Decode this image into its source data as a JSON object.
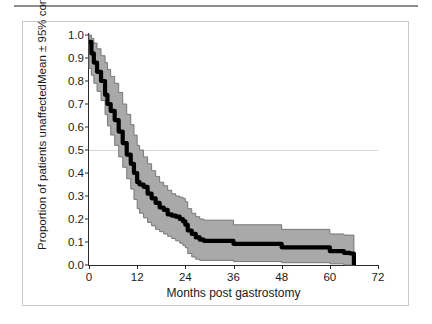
{
  "figure": {
    "axis_color": "#2b2b2b",
    "band_color": "#a9a9a9",
    "band_edge_color": "#6e6e6e",
    "mean_color": "#000000",
    "grid_color": "#d7d7d7",
    "frame_color": "#c9c9c9"
  },
  "chart_data": {
    "type": "line",
    "title": "",
    "subtitle": "",
    "xlabel": "Months post gastrostomy",
    "ylabel_line1": "Proportion of patients unaffected",
    "ylabel_line2": "Mean ± 95% confidence interval",
    "xlim": [
      0,
      72
    ],
    "ylim": [
      0,
      1.0
    ],
    "xticks": [
      0,
      12,
      24,
      36,
      48,
      60,
      72
    ],
    "xtick_labels": [
      "0",
      "12",
      "24",
      "36",
      "48",
      "60",
      "72"
    ],
    "yticks": [
      0.0,
      0.1,
      0.2,
      0.3,
      0.4,
      0.5,
      0.6,
      0.7,
      0.8,
      0.9,
      1.0
    ],
    "ytick_labels": [
      "0.0",
      "0.1",
      "0.2",
      "0.3",
      "0.4",
      "0.5",
      "0.6",
      "0.7",
      "0.8",
      "0.9",
      "1.0"
    ],
    "grid": "single horizontal gridline at y = 0.5",
    "gridlines_y": [
      0.5
    ],
    "legend": "none",
    "annotations": [],
    "series": [
      {
        "name": "Mean proportion unaffected",
        "style": "thick black step curve",
        "x": [
          0,
          0.6,
          1.2,
          2.0,
          3.0,
          4.0,
          4.6,
          5.4,
          6.4,
          7.4,
          8.4,
          9.4,
          10.4,
          11.2,
          12.0,
          12.6,
          13.6,
          14.6,
          15.6,
          16.6,
          17.6,
          18.6,
          19.6,
          20.6,
          21.6,
          22.6,
          23.4,
          24.0,
          24.6,
          25.6,
          26.6,
          27.6,
          28.6,
          36.0,
          48.0,
          60.0,
          63.5,
          65.0,
          66.0
        ],
        "y": [
          0.97,
          0.92,
          0.88,
          0.84,
          0.8,
          0.74,
          0.7,
          0.67,
          0.63,
          0.58,
          0.53,
          0.48,
          0.44,
          0.4,
          0.36,
          0.35,
          0.34,
          0.31,
          0.29,
          0.27,
          0.25,
          0.24,
          0.22,
          0.215,
          0.21,
          0.2,
          0.19,
          0.175,
          0.15,
          0.135,
          0.12,
          0.11,
          0.105,
          0.092,
          0.077,
          0.06,
          0.053,
          0.05,
          0.0
        ]
      },
      {
        "name": "Upper 95% confidence limit",
        "style": "grey band upper edge",
        "x": [
          0,
          0.6,
          1.2,
          2.0,
          3.0,
          4.0,
          4.6,
          5.4,
          6.4,
          7.4,
          8.4,
          9.4,
          10.4,
          11.2,
          12.0,
          12.6,
          13.6,
          14.6,
          15.6,
          16.6,
          17.6,
          18.6,
          19.6,
          20.6,
          21.6,
          22.6,
          23.4,
          24.0,
          24.6,
          25.6,
          26.6,
          27.6,
          28.6,
          36.0,
          48.0,
          60.0,
          63.5,
          65.0,
          66.0
        ],
        "y": [
          1.0,
          0.985,
          0.965,
          0.94,
          0.91,
          0.88,
          0.85,
          0.82,
          0.79,
          0.75,
          0.7,
          0.655,
          0.61,
          0.565,
          0.52,
          0.5,
          0.47,
          0.44,
          0.41,
          0.385,
          0.36,
          0.345,
          0.325,
          0.31,
          0.3,
          0.295,
          0.29,
          0.275,
          0.245,
          0.225,
          0.21,
          0.2,
          0.195,
          0.175,
          0.155,
          0.135,
          0.13,
          0.13,
          0.0
        ]
      },
      {
        "name": "Lower 95% confidence limit",
        "style": "grey band lower edge",
        "x": [
          0,
          0.6,
          1.2,
          2.0,
          3.0,
          4.0,
          4.6,
          5.4,
          6.4,
          7.4,
          8.4,
          9.4,
          10.4,
          11.2,
          12.0,
          12.6,
          13.6,
          14.6,
          15.6,
          16.6,
          17.6,
          18.6,
          19.6,
          20.6,
          21.6,
          22.6,
          23.4,
          24.0,
          24.6,
          25.6,
          26.6,
          27.6,
          28.6,
          36.0,
          48.0,
          60.0,
          63.5,
          65.0,
          66.0
        ],
        "y": [
          0.855,
          0.825,
          0.79,
          0.755,
          0.715,
          0.655,
          0.605,
          0.565,
          0.52,
          0.47,
          0.425,
          0.375,
          0.33,
          0.285,
          0.245,
          0.225,
          0.205,
          0.185,
          0.17,
          0.155,
          0.145,
          0.135,
          0.125,
          0.115,
          0.105,
          0.095,
          0.085,
          0.075,
          0.05,
          0.035,
          0.025,
          0.02,
          0.02,
          0.015,
          0.01,
          0.005,
          0.0,
          0.0,
          0.0
        ]
      }
    ]
  }
}
